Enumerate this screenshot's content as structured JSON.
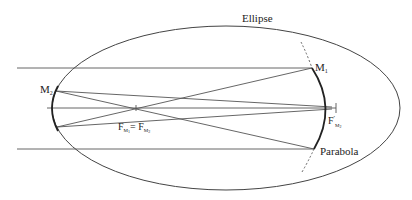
{
  "diagram": {
    "labels": {
      "ellipse": "Ellipse",
      "parabola": "Parabola",
      "m1": "M",
      "m1_sub": "1",
      "m2": "M",
      "m2_sub": "2",
      "focus_shared_main": "F",
      "focus_shared_sub1": "M",
      "focus_shared_sub1b": "1",
      "focus_shared_eq": "= F",
      "focus_shared_sub2": "M",
      "focus_shared_sub2b": "2",
      "focus_prime_main": "F",
      "focus_prime_mark": "′",
      "focus_prime_sub": "M",
      "focus_prime_subb": "2"
    },
    "elements": [
      "ellipse",
      "primary mirror M1 (parabola)",
      "secondary mirror M2 (ellipse)",
      "shared focus F_M1 = F_M2",
      "final focus F'_M2",
      "incoming parallel rays",
      "reflected rays"
    ]
  }
}
